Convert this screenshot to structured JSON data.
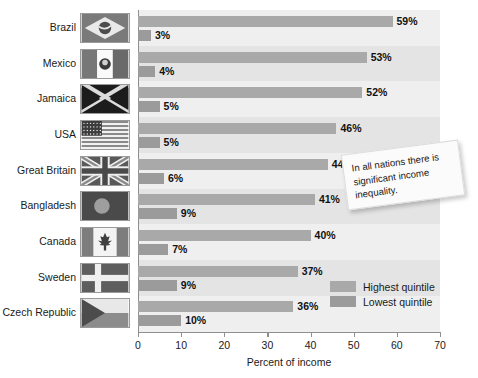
{
  "chart_data": {
    "type": "bar",
    "title": "",
    "xlabel": "Percent of income",
    "ylabel": "",
    "xlim": [
      0,
      70
    ],
    "xticks": [
      0,
      10,
      20,
      30,
      40,
      50,
      60,
      70
    ],
    "grid": false,
    "orientation": "horizontal",
    "legend_position": "inside-bottom-right",
    "categories": [
      "Brazil",
      "Mexico",
      "Jamaica",
      "USA",
      "Great Britain",
      "Bangladesh",
      "Canada",
      "Sweden",
      "Czech Republic"
    ],
    "series": [
      {
        "name": "Highest quintile",
        "color": "#a9a9a9",
        "values": [
          59,
          53,
          52,
          46,
          44,
          41,
          40,
          37,
          36
        ],
        "labels": [
          "59%",
          "53%",
          "52%",
          "46%",
          "44%",
          "41%",
          "40%",
          "37%",
          "36%"
        ]
      },
      {
        "name": "Lowest quintile",
        "color": "#9b9b9b",
        "values": [
          3,
          4,
          5,
          5,
          6,
          9,
          7,
          9,
          10
        ],
        "labels": [
          "3%",
          "4%",
          "5%",
          "5%",
          "6%",
          "9%",
          "7%",
          "9%",
          "10%"
        ]
      }
    ],
    "annotations": [
      {
        "name": "sticky-note",
        "text": "In all nations there is significant income inequality."
      }
    ]
  },
  "flags": [
    {
      "country": "Brazil",
      "icon": "flag-brazil-icon"
    },
    {
      "country": "Mexico",
      "icon": "flag-mexico-icon"
    },
    {
      "country": "Jamaica",
      "icon": "flag-jamaica-icon"
    },
    {
      "country": "USA",
      "icon": "flag-usa-icon"
    },
    {
      "country": "Great Britain",
      "icon": "flag-great-britain-icon"
    },
    {
      "country": "Bangladesh",
      "icon": "flag-bangladesh-icon"
    },
    {
      "country": "Canada",
      "icon": "flag-canada-icon"
    },
    {
      "country": "Sweden",
      "icon": "flag-sweden-icon"
    },
    {
      "country": "Czech Republic",
      "icon": "flag-czech-republic-icon"
    }
  ],
  "colors": {
    "plot_background": "#efefef",
    "band": "#e4e4e4",
    "axis": "#8f8f8f",
    "highest_quintile": "#a9a9a9",
    "lowest_quintile": "#9b9b9b",
    "text": "#1a1a1a"
  }
}
